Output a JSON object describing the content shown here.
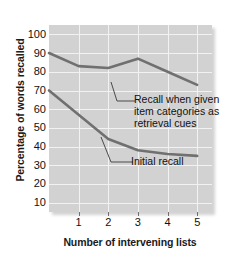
{
  "chart_data": {
    "type": "line",
    "title": "",
    "xlabel": "Number of intervening lists",
    "ylabel": "Percentage of words recalled",
    "x": [
      0,
      1,
      2,
      3,
      4,
      5
    ],
    "xtick_labels": [
      "1",
      "2",
      "3",
      "4",
      "5"
    ],
    "xticks": [
      1,
      2,
      3,
      4,
      5
    ],
    "xlim": [
      0,
      5.5
    ],
    "ytick_labels": [
      "10",
      "20",
      "30",
      "40",
      "50",
      "60",
      "70",
      "80",
      "90",
      "100"
    ],
    "yticks": [
      10,
      20,
      30,
      40,
      50,
      60,
      70,
      80,
      90,
      100
    ],
    "ylim": [
      5,
      105
    ],
    "grid": true,
    "legend_position": "inline-annotations",
    "plot_background": "#d2d2d2",
    "gridline_color": "#f2f2f2",
    "series": [
      {
        "name": "Recall when given item categories as retrieval cues",
        "values": [
          90,
          83,
          82,
          87,
          80,
          73
        ],
        "color": "#707070",
        "annotation": "Recall when given item categories as retrieval cues"
      },
      {
        "name": "Initial recall",
        "values": [
          70,
          57,
          44,
          38,
          36,
          35
        ],
        "color": "#707070",
        "annotation": "Initial recall"
      }
    ],
    "annotations": [
      {
        "text": "Recall when given item categories as retrieval cues",
        "series": "cued"
      },
      {
        "text": "Initial recall",
        "series": "initial"
      }
    ]
  },
  "axes": {
    "y_title": "Percentage of words recalled",
    "x_title": "Number of intervening lists"
  },
  "labels": {
    "annotation_cued_line1": "Recall when given",
    "annotation_cued_line2": "item categories as",
    "annotation_cued_line3": "retrieval cues",
    "annotation_initial": "Initial recall"
  }
}
